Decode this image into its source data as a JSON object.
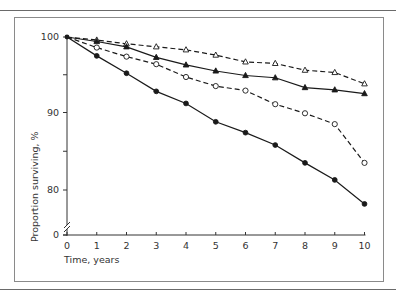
{
  "chart_data": {
    "type": "line",
    "title": "",
    "xlabel": "Time, years",
    "ylabel": "Proportion surviving, %",
    "x": [
      0,
      1,
      2,
      3,
      4,
      5,
      6,
      7,
      8,
      9,
      10
    ],
    "xticks": [
      "0",
      "1",
      "2",
      "3",
      "4",
      "5",
      "6",
      "7",
      "8",
      "9",
      "10"
    ],
    "yticks": [
      "0",
      "80",
      "90",
      "100"
    ],
    "ylim": [
      78,
      100
    ],
    "y_axis_break": "between 0 and 80",
    "grid": false,
    "legend": "none",
    "series": [
      {
        "name": "open triangles (dashed)",
        "marker": "open-triangle",
        "line": "dashed",
        "values": [
          100,
          99.6,
          99.1,
          98.7,
          98.3,
          97.6,
          96.7,
          96.5,
          95.6,
          95.3,
          93.8
        ]
      },
      {
        "name": "filled triangles (solid)",
        "marker": "filled-triangle",
        "line": "solid",
        "values": [
          100,
          99.4,
          98.7,
          97.3,
          96.3,
          95.5,
          94.9,
          94.6,
          93.3,
          93.0,
          92.5
        ]
      },
      {
        "name": "open circles (dashed)",
        "marker": "open-circle",
        "line": "dashed",
        "values": [
          100,
          98.6,
          97.4,
          96.4,
          94.7,
          93.5,
          92.9,
          91.1,
          89.9,
          88.5,
          83.5
        ]
      },
      {
        "name": "filled circles (solid)",
        "marker": "filled-circle",
        "line": "solid",
        "values": [
          100,
          97.5,
          95.2,
          92.8,
          91.2,
          88.8,
          87.4,
          85.8,
          83.5,
          81.3,
          78.2
        ]
      }
    ]
  },
  "axes": {
    "xlabel": "Time, years",
    "ylabel": "Proportion surviving, %",
    "xtick_labels": [
      "0",
      "1",
      "2",
      "3",
      "4",
      "5",
      "6",
      "7",
      "8",
      "9",
      "10"
    ],
    "ytick_labels": {
      "y0": "0",
      "y80": "80",
      "y90": "90",
      "y100": "100"
    }
  },
  "colors": {
    "ink": "#1a1a1a",
    "frame": "#8a8a8a",
    "background": "#ffffff"
  }
}
